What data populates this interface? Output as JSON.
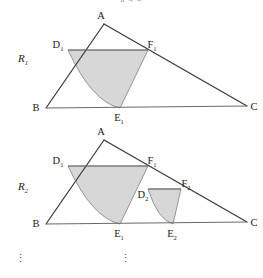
{
  "figure": {
    "top_note": "n → ∞",
    "ellipsis_glyph": "⋮",
    "colors": {
      "region_fill": "#d4d4d4",
      "outline": "#3a3a3a",
      "baseline": "#6a6a6a",
      "text": "#1a1a1a"
    },
    "panels": [
      {
        "name": "R1",
        "label_base": "R",
        "label_sub": "1",
        "vertices": [
          {
            "name": "A",
            "base": "A",
            "sub": "",
            "x": 104,
            "y": 24
          },
          {
            "name": "B",
            "base": "B",
            "sub": "",
            "x": 46,
            "y": 108
          },
          {
            "name": "C",
            "base": "C",
            "sub": "",
            "x": 247,
            "y": 106
          },
          {
            "name": "D1",
            "base": "D",
            "sub": "1",
            "x": 68,
            "y": 50
          },
          {
            "name": "E1",
            "base": "E",
            "sub": "1",
            "x": 120,
            "y": 108
          },
          {
            "name": "F1",
            "base": "F",
            "sub": "1",
            "x": 148,
            "y": 50
          }
        ],
        "regions": [
          {
            "name": "region-1",
            "chord": "D1-F1",
            "arc": "D1-E1",
            "edge": "E1-F1"
          }
        ]
      },
      {
        "name": "R2",
        "label_base": "R",
        "label_sub": "2",
        "vertices": [
          {
            "name": "A",
            "base": "A",
            "sub": "",
            "x": 104,
            "y": 140
          },
          {
            "name": "B",
            "base": "B",
            "sub": "",
            "x": 46,
            "y": 224
          },
          {
            "name": "C",
            "base": "C",
            "sub": "",
            "x": 247,
            "y": 222
          },
          {
            "name": "D1",
            "base": "D",
            "sub": "1",
            "x": 68,
            "y": 166
          },
          {
            "name": "E1",
            "base": "E",
            "sub": "1",
            "x": 120,
            "y": 224
          },
          {
            "name": "F1",
            "base": "F",
            "sub": "1",
            "x": 148,
            "y": 166
          },
          {
            "name": "D2",
            "base": "D",
            "sub": "2",
            "x": 145,
            "y": 189
          },
          {
            "name": "E2",
            "base": "E",
            "sub": "2",
            "x": 173,
            "y": 224
          },
          {
            "name": "F2",
            "base": "F",
            "sub": "2",
            "x": 181,
            "y": 189
          }
        ],
        "regions": [
          {
            "name": "region-1",
            "chord": "D1-F1",
            "arc": "D1-E1",
            "edge": "E1-F1"
          },
          {
            "name": "region-2",
            "chord": "D2-F2",
            "arc": "D2-E2",
            "edge": "E2-F2"
          }
        ]
      }
    ]
  }
}
